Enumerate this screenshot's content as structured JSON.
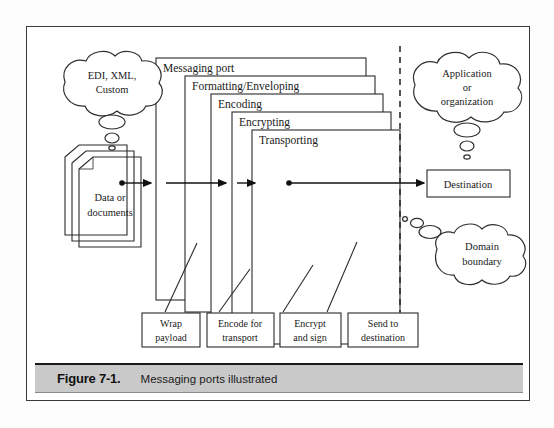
{
  "figure": {
    "number": "Figure 7-1.",
    "caption": "Messaging ports illustrated"
  },
  "diagram": {
    "title": "Messaging ports illustrated",
    "source_cloud": {
      "line1": "EDI, XML,",
      "line2": "Custom"
    },
    "source_documents": {
      "line1": "Data or",
      "line2": "documents"
    },
    "nested_layers": [
      {
        "label": "Messaging port"
      },
      {
        "label": "Formatting/Enveloping"
      },
      {
        "label": "Encoding"
      },
      {
        "label": "Encrypting"
      },
      {
        "label": "Transporting"
      }
    ],
    "callouts": [
      {
        "line1": "Wrap",
        "line2": "payload"
      },
      {
        "line1": "Encode for",
        "line2": "transport"
      },
      {
        "line1": "Encrypt",
        "line2": "and sign"
      },
      {
        "line1": "Send to",
        "line2": "destination"
      }
    ],
    "destination_cloud": {
      "line1": "Application",
      "line2": "or",
      "line3": "organization"
    },
    "destination_box": {
      "label": "Destination"
    },
    "boundary_cloud": {
      "line1": "Domain",
      "line2": "boundary"
    },
    "boundary_line": {
      "name": "domain-boundary-dashed-line"
    }
  },
  "colors": {
    "ink": "#2b2b2b",
    "caption_bar": "#c9c9c9",
    "frame": "#3a3a3a",
    "paper": "#ffffff"
  }
}
